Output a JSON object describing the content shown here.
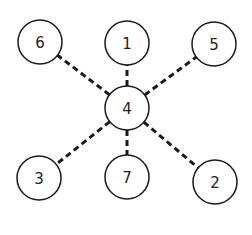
{
  "diagram": {
    "type": "graph",
    "colors": {
      "stroke": "#1a1a1a",
      "fill": "#ffffff",
      "text": "#222222"
    },
    "nodes": [
      {
        "id": "1",
        "label": "1",
        "x": 127,
        "y": 43
      },
      {
        "id": "2",
        "label": "2",
        "x": 215,
        "y": 182
      },
      {
        "id": "3",
        "label": "3",
        "x": 39,
        "y": 178
      },
      {
        "id": "4",
        "label": "4",
        "x": 127,
        "y": 108
      },
      {
        "id": "5",
        "label": "5",
        "x": 214,
        "y": 44
      },
      {
        "id": "6",
        "label": "6",
        "x": 40,
        "y": 42
      },
      {
        "id": "7",
        "label": "7",
        "x": 127,
        "y": 177
      }
    ],
    "edges": [
      {
        "from": "4",
        "to": "1",
        "style": "dashed"
      },
      {
        "from": "4",
        "to": "2",
        "style": "dashed"
      },
      {
        "from": "4",
        "to": "3",
        "style": "dashed"
      },
      {
        "from": "4",
        "to": "5",
        "style": "dashed"
      },
      {
        "from": "4",
        "to": "6",
        "style": "dashed"
      },
      {
        "from": "4",
        "to": "7",
        "style": "dashed"
      }
    ],
    "node_radius": 22
  }
}
